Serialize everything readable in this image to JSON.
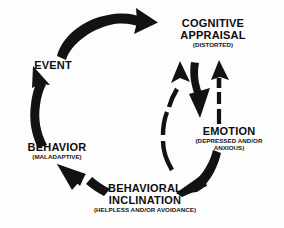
{
  "diagram": {
    "background_color": "#fdfdfd",
    "ink_color": "#111111",
    "nodes": [
      {
        "id": "event",
        "title": "EVENT",
        "subtitle": ""
      },
      {
        "id": "cognitive_appraisal",
        "title_line1": "COGNITIVE",
        "title_line2": "APPRAISAL",
        "subtitle": "(DISTORTED)"
      },
      {
        "id": "emotion",
        "title": "EMOTION",
        "subtitle_line1": "(DEPRESSED AND/OR",
        "subtitle_line2": "ANXIOUS)"
      },
      {
        "id": "behavioral_inclination",
        "title_line1": "BEHAVIORAL",
        "title_line2": "INCLINATION",
        "subtitle": "(HELPLESS AND/OR AVOIDANCE)"
      },
      {
        "id": "behavior",
        "title": "BEHAVIOR",
        "subtitle": "(MALADAPTIVE)"
      }
    ],
    "arrows": [
      {
        "id": "event-to-cognitive",
        "from": "event",
        "to": "cognitive_appraisal",
        "style": "solid",
        "direction": "clockwise-top"
      },
      {
        "id": "cognitive-to-emotion",
        "from": "cognitive_appraisal",
        "to": "emotion",
        "style": "solid",
        "direction": "down"
      },
      {
        "id": "emotion-to-cognitive",
        "from": "emotion",
        "to": "cognitive_appraisal",
        "style": "dashed",
        "direction": "up"
      },
      {
        "id": "behavioral-to-cognitive",
        "from": "behavioral_inclination",
        "to": "cognitive_appraisal",
        "style": "dashed",
        "direction": "up"
      },
      {
        "id": "emotion-to-behavioral",
        "from": "emotion",
        "to": "behavioral_inclination",
        "style": "solid",
        "direction": "down-left"
      },
      {
        "id": "behavioral-to-behavior",
        "from": "behavioral_inclination",
        "to": "behavior",
        "style": "solid",
        "direction": "up-left"
      },
      {
        "id": "behavior-to-event",
        "from": "behavior",
        "to": "event",
        "style": "solid",
        "direction": "up"
      }
    ]
  }
}
